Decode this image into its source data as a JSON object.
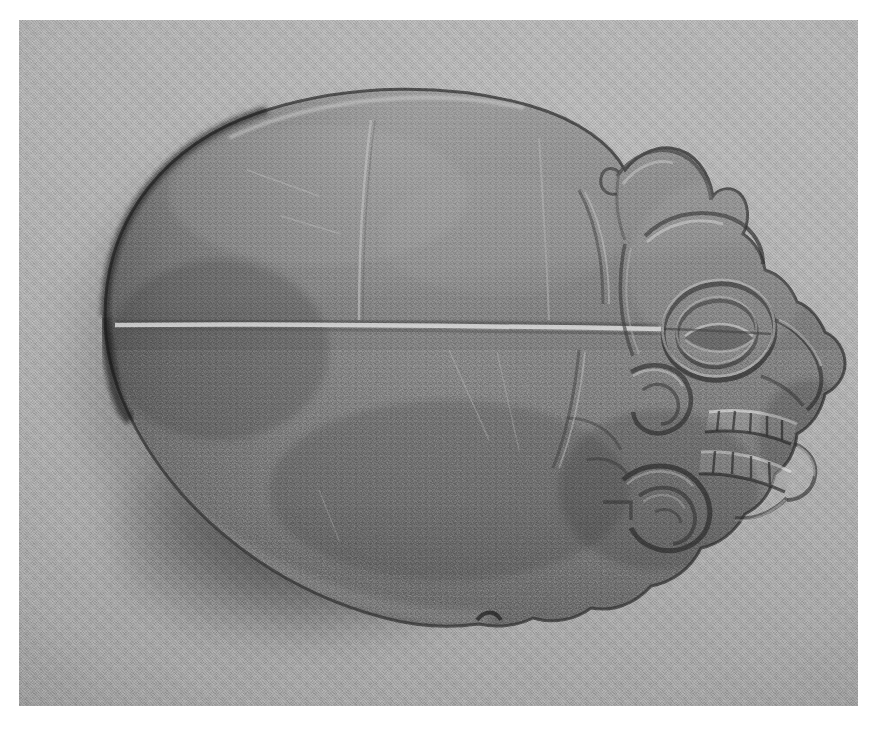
{
  "photograph": {
    "medium": "black-and-white photograph",
    "orientation": "landscape",
    "border_color": "#ffffff",
    "backdrop_color": "#b3b3b3",
    "backdrop_description": "plain light gray fabric backdrop with fine woven texture",
    "lighting": "single soft light from upper right casting a shadow to the lower left"
  },
  "subject": {
    "name": "carved stone artifact",
    "type": "votive axe / hacha",
    "material": "polished gray-green stone",
    "view": "profile facing right",
    "stone_color_upper": "#888888",
    "stone_color_lower": "#787878",
    "edge_color": "#2b2b2b",
    "highlight_color": "#d4d4d4"
  },
  "features": [
    {
      "id": "blade-body",
      "label": "broad rounded blade body"
    },
    {
      "id": "incised-line",
      "label": "horizontal incised groove across blade"
    },
    {
      "id": "vertical-line",
      "label": "faint vertical incised line on blade"
    },
    {
      "id": "crest",
      "label": "rounded cranial crest / headdress lobe"
    },
    {
      "id": "brow-ridge",
      "label": "raised brow ridge"
    },
    {
      "id": "eye",
      "label": "concentric almond-shaped eye"
    },
    {
      "id": "nose",
      "label": "projecting nose in profile"
    },
    {
      "id": "upper-teeth",
      "label": "row of bared upper teeth"
    },
    {
      "id": "lower-teeth",
      "label": "row of bared lower teeth"
    },
    {
      "id": "lip-flange",
      "label": "down-turned lip flange"
    },
    {
      "id": "chin",
      "label": "receding chin"
    },
    {
      "id": "cheek-scroll",
      "label": "spiral scroll motif on cheek"
    },
    {
      "id": "jaw-scroll",
      "label": "curved scroll motif along jaw"
    },
    {
      "id": "ear-band",
      "label": "curved band behind eye"
    },
    {
      "id": "notch",
      "label": "notch at lower jaw silhouette"
    }
  ],
  "shadow": {
    "label": "cast shadow",
    "direction": "lower-left",
    "color": "#6d6d6d"
  }
}
